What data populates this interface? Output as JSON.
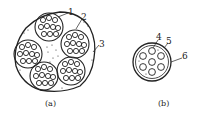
{
  "figure": {
    "panels": [
      {
        "id": "a",
        "caption": "(a)",
        "callouts": [
          {
            "label": "1"
          },
          {
            "label": "2"
          },
          {
            "label": "3"
          }
        ],
        "sub_bundle_count": 5
      },
      {
        "id": "b",
        "caption": "(b)",
        "callouts": [
          {
            "label": "4"
          },
          {
            "label": "5"
          },
          {
            "label": "6"
          }
        ]
      }
    ],
    "colors": {
      "line": "#222222",
      "background": "#ffffff"
    }
  }
}
